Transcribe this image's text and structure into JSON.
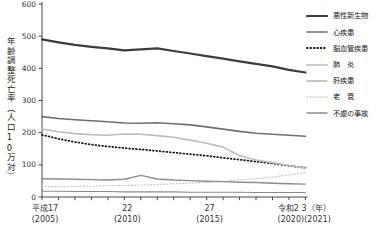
{
  "chart_data": {
    "type": "line",
    "title": "",
    "ylabel": "年齢調整死亡率（人口10万対）",
    "ylim": [
      0,
      600
    ],
    "y_ticks": [
      0,
      100,
      200,
      300,
      400,
      500,
      600
    ],
    "x": [
      2005,
      2006,
      2007,
      2008,
      2009,
      2010,
      2011,
      2012,
      2013,
      2014,
      2015,
      2016,
      2017,
      2018,
      2019,
      2020,
      2021
    ],
    "x_axis_labels": [
      {
        "era": "平成17",
        "west": "(2005)",
        "years": [
          2005
        ]
      },
      {
        "era": "22",
        "west": "(2010)",
        "years": [
          2010
        ]
      },
      {
        "era": "27",
        "west": "(2015)",
        "years": [
          2015
        ]
      },
      {
        "era": "令和2 3（年）",
        "west": "(2020)(2021)",
        "years": [
          2020,
          2021
        ]
      }
    ],
    "grid": false,
    "legend_position": "right",
    "series": [
      {
        "name": "悪性新生物",
        "color": "#3c3c3c",
        "width": 2.2,
        "dash": "",
        "values": [
          490,
          481,
          473,
          467,
          462,
          456,
          459,
          462,
          454,
          446,
          438,
          430,
          422,
          414,
          406,
          395,
          387
        ]
      },
      {
        "name": "心疾患",
        "color": "#6f6f6f",
        "width": 1.6,
        "dash": "",
        "values": [
          250,
          244,
          240,
          237,
          234,
          230,
          229,
          231,
          228,
          224,
          218,
          211,
          204,
          198,
          195,
          192,
          189
        ]
      },
      {
        "name": "脳血管疾患",
        "color": "#191919",
        "width": 1.8,
        "dash": "0.8 2.6",
        "values": [
          193,
          181,
          171,
          163,
          157,
          152,
          148,
          143,
          138,
          133,
          128,
          122,
          116,
          110,
          104,
          97,
          91
        ]
      },
      {
        "name": "肺　炎",
        "color": "#bdbdbd",
        "width": 1.6,
        "dash": "",
        "values": [
          211,
          203,
          197,
          194,
          192,
          196,
          195,
          191,
          186,
          177,
          167,
          155,
          129,
          115,
          107,
          98,
          90
        ]
      },
      {
        "name": "肝疾患",
        "color": "#8c8c8c",
        "width": 1.1,
        "dash": "",
        "values": [
          18,
          18,
          17,
          17,
          17,
          16,
          16,
          16,
          16,
          15,
          15,
          15,
          15,
          14,
          14,
          14,
          14
        ]
      },
      {
        "name": "老　衰",
        "color": "#c8c8c8",
        "width": 1.3,
        "dash": "0.8 2.4",
        "values": [
          32,
          32,
          33,
          34,
          35,
          36,
          37,
          39,
          41,
          43,
          46,
          49,
          53,
          57,
          62,
          69,
          76
        ]
      },
      {
        "name": "不慮の事故",
        "color": "#8c8c8c",
        "width": 1.4,
        "dash": "",
        "values": [
          57,
          56,
          55,
          54,
          53,
          55,
          67,
          56,
          53,
          51,
          49,
          48,
          46,
          45,
          43,
          41,
          40
        ]
      }
    ]
  }
}
